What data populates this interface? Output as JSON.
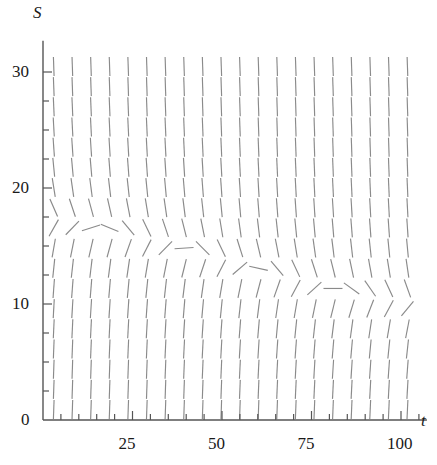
{
  "figure": {
    "kind": "slope-field",
    "background": "#ffffff",
    "stroke_color": "#8a8a8a",
    "axis_color": "#555555"
  },
  "axes": {
    "x": {
      "label": "t",
      "min": 0,
      "max": 105,
      "major_ticks": [
        25,
        50,
        75,
        100
      ],
      "major_tick_labels": [
        "25",
        "50",
        "75",
        "100"
      ],
      "minor_tick_step": 5,
      "pixel_origin": 43,
      "pixel_per_unit": 3.58
    },
    "y": {
      "label": "S",
      "min": 0,
      "max": 32,
      "major_ticks": [
        0,
        10,
        20,
        30
      ],
      "major_tick_labels": [
        "0",
        "10",
        "20",
        "30"
      ],
      "minor_tick_step": 2.5,
      "pixel_origin": 420,
      "pixel_per_unit": 11.6
    }
  },
  "chart_data": {
    "type": "scatter",
    "title": "",
    "xlabel": "t",
    "ylabel": "S",
    "xlim": [
      0,
      105
    ],
    "ylim": [
      0,
      32
    ],
    "grid": false,
    "legend": null,
    "field": {
      "t_grid_start": 3,
      "t_grid_step": 5.2,
      "t_grid_count": 20,
      "s_grid_start": 0.9,
      "s_grid_step": 1.74,
      "s_grid_count": 18,
      "dash_length_px": 19,
      "equilibrium_curve": {
        "name": "nullcline (slope = 0)",
        "points_t": [
          0,
          10,
          20,
          30,
          40,
          50,
          60,
          70,
          80,
          90,
          100,
          105
        ],
        "points_S": [
          17.5,
          16.9,
          16.3,
          15.6,
          14.8,
          13.9,
          13.0,
          12.2,
          11.4,
          10.8,
          10.2,
          10.0
        ]
      },
      "slope_model": {
        "form": "dS/dt = k * (S - E(t)) scaled for display",
        "k": -0.95,
        "note": "dashes above the nullcline slant down-right, below slant up-right; magnitude grows with distance from the nullcline and saturates near vertical"
      }
    }
  }
}
